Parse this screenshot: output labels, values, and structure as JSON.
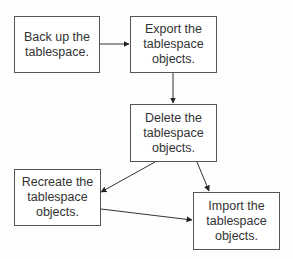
{
  "diagram": {
    "type": "flowchart",
    "nodes": [
      {
        "id": "backup",
        "label": "Back up the\ntablespace."
      },
      {
        "id": "export",
        "label": "Export the\ntablespace\nobjects."
      },
      {
        "id": "delete",
        "label": "Delete the\ntablespace\nobjects."
      },
      {
        "id": "recreate",
        "label": "Recreate the\ntablespace\nobjects."
      },
      {
        "id": "import",
        "label": "Import the\ntablespace\nobjects."
      }
    ],
    "edges": [
      {
        "from": "backup",
        "to": "export"
      },
      {
        "from": "export",
        "to": "delete"
      },
      {
        "from": "delete",
        "to": "recreate"
      },
      {
        "from": "delete",
        "to": "import"
      },
      {
        "from": "recreate",
        "to": "import"
      }
    ],
    "colors": {
      "line": "#333333",
      "border": "#555555",
      "text": "#333333"
    }
  }
}
